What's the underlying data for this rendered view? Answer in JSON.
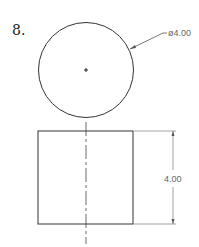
{
  "problem": {
    "number": "8."
  },
  "top_view": {
    "diameter_label": "ø4.00"
  },
  "front_view": {
    "height_label": "4.00"
  }
}
